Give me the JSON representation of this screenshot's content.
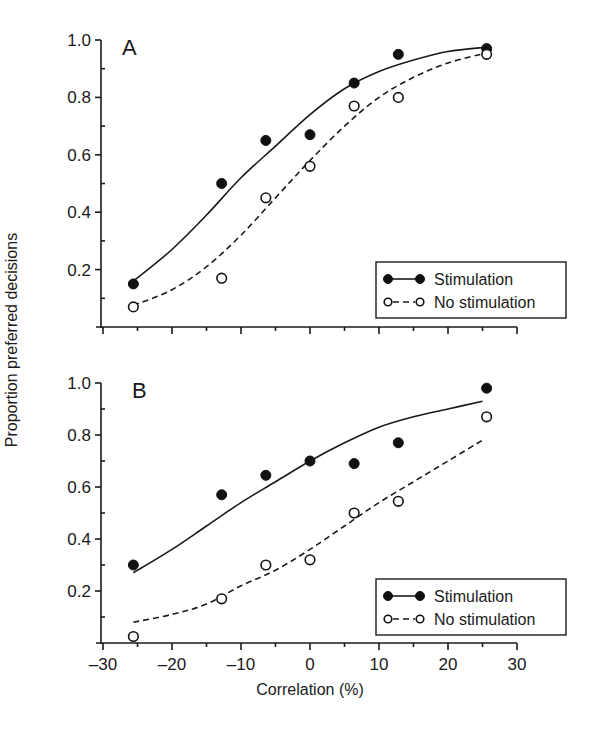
{
  "chart_data": [
    {
      "type": "scatter",
      "panel": "A",
      "title": "A",
      "xlabel": "Correlation (%)",
      "ylabel": "Proportion preferred decisions",
      "xlim": [
        -30,
        30
      ],
      "ylim": [
        0,
        1.0
      ],
      "xticks": [
        -30,
        -20,
        -10,
        0,
        10,
        20,
        30
      ],
      "yticks": [
        0.2,
        0.4,
        0.6,
        0.8,
        1.0
      ],
      "grid": false,
      "legend_position": "lower right",
      "x": [
        -25.6,
        -12.8,
        -6.4,
        0,
        6.4,
        12.8,
        25.6
      ],
      "series": [
        {
          "name": "Stimulation",
          "marker": "filled-circle",
          "line": "solid",
          "values": [
            0.15,
            0.5,
            0.65,
            0.67,
            0.85,
            0.95,
            0.97
          ],
          "fit": [
            [
              -25.6,
              0.16
            ],
            [
              -20,
              0.27
            ],
            [
              -15,
              0.39
            ],
            [
              -10,
              0.52
            ],
            [
              -5,
              0.63
            ],
            [
              0,
              0.74
            ],
            [
              5,
              0.83
            ],
            [
              10,
              0.89
            ],
            [
              15,
              0.93
            ],
            [
              20,
              0.96
            ],
            [
              25.6,
              0.975
            ]
          ]
        },
        {
          "name": "No stimulation",
          "marker": "open-circle",
          "line": "dashed",
          "values": [
            0.07,
            0.17,
            0.45,
            0.56,
            0.77,
            0.8,
            0.95
          ],
          "fit": [
            [
              -25.6,
              0.075
            ],
            [
              -20,
              0.13
            ],
            [
              -15,
              0.21
            ],
            [
              -10,
              0.32
            ],
            [
              -5,
              0.45
            ],
            [
              0,
              0.58
            ],
            [
              5,
              0.7
            ],
            [
              10,
              0.8
            ],
            [
              15,
              0.87
            ],
            [
              20,
              0.92
            ],
            [
              25.6,
              0.955
            ]
          ]
        }
      ]
    },
    {
      "type": "scatter",
      "panel": "B",
      "title": "B",
      "xlabel": "Correlation (%)",
      "ylabel": "Proportion preferred decisions",
      "xlim": [
        -30,
        30
      ],
      "ylim": [
        0,
        1.0
      ],
      "xticks": [
        -30,
        -20,
        -10,
        0,
        10,
        20,
        30
      ],
      "yticks": [
        0.2,
        0.4,
        0.6,
        0.8,
        1.0
      ],
      "grid": false,
      "legend_position": "lower right",
      "x": [
        -25.6,
        -12.8,
        -6.4,
        0,
        6.4,
        12.8,
        25.6
      ],
      "series": [
        {
          "name": "Stimulation",
          "marker": "filled-circle",
          "line": "solid",
          "values": [
            0.3,
            0.57,
            0.645,
            0.7,
            0.69,
            0.77,
            0.98
          ],
          "fit": [
            [
              -25.6,
              0.27
            ],
            [
              -20,
              0.36
            ],
            [
              -15,
              0.45
            ],
            [
              -10,
              0.54
            ],
            [
              -5,
              0.62
            ],
            [
              0,
              0.7
            ],
            [
              5,
              0.77
            ],
            [
              10,
              0.83
            ],
            [
              15,
              0.87
            ],
            [
              20,
              0.9
            ],
            [
              25,
              0.93
            ]
          ]
        },
        {
          "name": "No stimulation",
          "marker": "open-circle",
          "line": "dashed",
          "values": [
            0.025,
            0.17,
            0.3,
            0.32,
            0.5,
            0.545,
            0.87
          ],
          "fit": [
            [
              -25.6,
              0.08
            ],
            [
              -20,
              0.11
            ],
            [
              -15,
              0.15
            ],
            [
              -10,
              0.22
            ],
            [
              -5,
              0.28
            ],
            [
              0,
              0.36
            ],
            [
              5,
              0.45
            ],
            [
              10,
              0.54
            ],
            [
              15,
              0.62
            ],
            [
              20,
              0.7
            ],
            [
              25,
              0.78
            ]
          ]
        }
      ]
    }
  ],
  "figure": {
    "ylabel": "Proportion preferred decisions",
    "xlabel": "Correlation (%)",
    "legend": {
      "stimulation": "Stimulation",
      "no_stimulation": "No stimulation"
    }
  }
}
